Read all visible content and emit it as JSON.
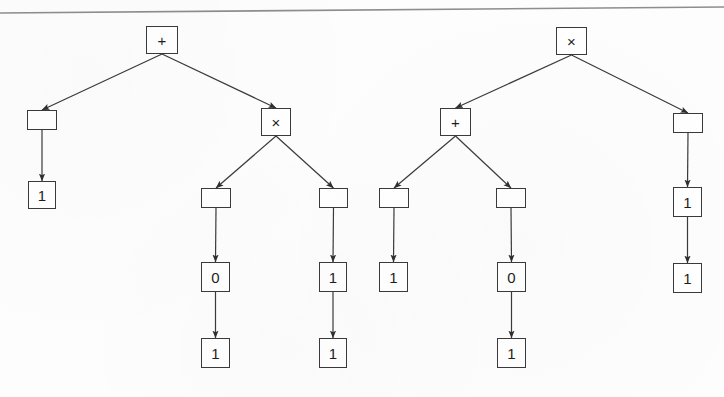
{
  "figure": {
    "background_color": "#fdfdfd",
    "stroke_color": "#3a3a3a",
    "text_color": "#1d1d1d",
    "scan_rule": {
      "name": "top-scan-line",
      "x1": 0,
      "y1": 13,
      "x2": 724,
      "y2": 7,
      "color": "#8d8d8d"
    }
  },
  "trees": [
    {
      "name": "left-expression-tree",
      "root_label": "+",
      "nodes": [
        {
          "id": "L-root",
          "label": "+",
          "kind": "operator",
          "x": 146,
          "y": 26,
          "w": 32,
          "h": 28
        },
        {
          "id": "L-a",
          "label": "",
          "kind": "blank",
          "x": 27,
          "y": 110,
          "w": 30,
          "h": 20
        },
        {
          "id": "L-a1",
          "label": "1",
          "kind": "leaf",
          "x": 28,
          "y": 181,
          "w": 28,
          "h": 28
        },
        {
          "id": "L-b",
          "label": "×",
          "kind": "operator",
          "x": 261,
          "y": 108,
          "w": 30,
          "h": 28
        },
        {
          "id": "L-b-l",
          "label": "",
          "kind": "blank",
          "x": 201,
          "y": 188,
          "w": 30,
          "h": 20
        },
        {
          "id": "L-b-l-0",
          "label": "0",
          "kind": "leaf",
          "x": 201,
          "y": 262,
          "w": 29,
          "h": 30
        },
        {
          "id": "L-b-l-0-1",
          "label": "1",
          "kind": "leaf",
          "x": 201,
          "y": 338,
          "w": 29,
          "h": 30
        },
        {
          "id": "L-b-r",
          "label": "",
          "kind": "blank",
          "x": 319,
          "y": 188,
          "w": 29,
          "h": 20
        },
        {
          "id": "L-b-r-1",
          "label": "1",
          "kind": "leaf",
          "x": 319,
          "y": 262,
          "w": 28,
          "h": 30
        },
        {
          "id": "L-b-r-1-1",
          "label": "1",
          "kind": "leaf",
          "x": 319,
          "y": 338,
          "w": 28,
          "h": 30
        }
      ],
      "edges": [
        {
          "from": "L-root",
          "to": "L-a"
        },
        {
          "from": "L-a",
          "to": "L-a1"
        },
        {
          "from": "L-root",
          "to": "L-b"
        },
        {
          "from": "L-b",
          "to": "L-b-l"
        },
        {
          "from": "L-b-l",
          "to": "L-b-l-0"
        },
        {
          "from": "L-b-l-0",
          "to": "L-b-l-0-1"
        },
        {
          "from": "L-b",
          "to": "L-b-r"
        },
        {
          "from": "L-b-r",
          "to": "L-b-r-1"
        },
        {
          "from": "L-b-r-1",
          "to": "L-b-r-1-1"
        }
      ]
    },
    {
      "name": "right-expression-tree",
      "root_label": "×",
      "nodes": [
        {
          "id": "R-root",
          "label": "×",
          "kind": "operator",
          "x": 556,
          "y": 27,
          "w": 31,
          "h": 28
        },
        {
          "id": "R-a",
          "label": "+",
          "kind": "operator",
          "x": 440,
          "y": 108,
          "w": 31,
          "h": 28
        },
        {
          "id": "R-a-l",
          "label": "",
          "kind": "blank",
          "x": 379,
          "y": 188,
          "w": 30,
          "h": 20
        },
        {
          "id": "R-a-l-1",
          "label": "1",
          "kind": "leaf",
          "x": 379,
          "y": 262,
          "w": 29,
          "h": 30
        },
        {
          "id": "R-a-r",
          "label": "",
          "kind": "blank",
          "x": 496,
          "y": 188,
          "w": 30,
          "h": 20
        },
        {
          "id": "R-a-r-0",
          "label": "0",
          "kind": "leaf",
          "x": 497,
          "y": 262,
          "w": 29,
          "h": 30
        },
        {
          "id": "R-a-r-0-1",
          "label": "1",
          "kind": "leaf",
          "x": 497,
          "y": 338,
          "w": 29,
          "h": 30
        },
        {
          "id": "R-b",
          "label": "",
          "kind": "blank",
          "x": 673,
          "y": 113,
          "w": 30,
          "h": 20
        },
        {
          "id": "R-b-1",
          "label": "1",
          "kind": "leaf",
          "x": 673,
          "y": 187,
          "w": 29,
          "h": 30
        },
        {
          "id": "R-b-1-1",
          "label": "1",
          "kind": "leaf",
          "x": 673,
          "y": 263,
          "w": 29,
          "h": 30
        }
      ],
      "edges": [
        {
          "from": "R-root",
          "to": "R-a"
        },
        {
          "from": "R-a",
          "to": "R-a-l"
        },
        {
          "from": "R-a-l",
          "to": "R-a-l-1"
        },
        {
          "from": "R-a",
          "to": "R-a-r"
        },
        {
          "from": "R-a-r",
          "to": "R-a-r-0"
        },
        {
          "from": "R-a-r-0",
          "to": "R-a-r-0-1"
        },
        {
          "from": "R-root",
          "to": "R-b"
        },
        {
          "from": "R-b",
          "to": "R-b-1"
        },
        {
          "from": "R-b-1",
          "to": "R-b-1-1"
        }
      ]
    }
  ]
}
